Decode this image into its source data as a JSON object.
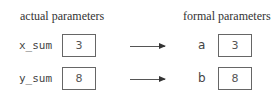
{
  "headers": {
    "actual": "actual parameters",
    "formal": "formal parameters"
  },
  "actual_parameters": [
    {
      "name": "x_sum",
      "value": "3"
    },
    {
      "name": "y_sum",
      "value": "8"
    }
  ],
  "formal_parameters": [
    {
      "name": "a",
      "value": "3"
    },
    {
      "name": "b",
      "value": "8"
    }
  ]
}
